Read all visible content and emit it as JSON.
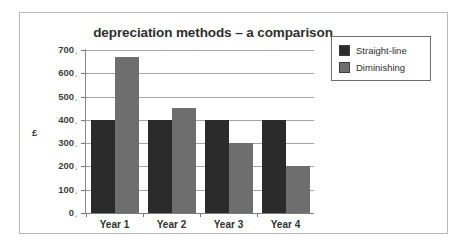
{
  "figure": {
    "border_color": "#b9b9b9",
    "background": "#ffffff"
  },
  "chart_data": {
    "type": "bar",
    "title": "depreciation methods – a comparison",
    "xlabel": "",
    "ylabel": "£",
    "categories": [
      "Year 1",
      "Year 2",
      "Year 3",
      "Year 4"
    ],
    "series": [
      {
        "name": "Straight-line",
        "color": "#2b2b2b",
        "values": [
          400,
          400,
          400,
          400
        ]
      },
      {
        "name": "Diminishing",
        "color": "#6e6e6e",
        "values": [
          670,
          450,
          300,
          200
        ]
      }
    ],
    "ylim": [
      0,
      700
    ],
    "ytick_step": 100,
    "ytick_labels": [
      "700",
      "600",
      "500",
      "400",
      "300",
      "200",
      "100",
      "0"
    ],
    "grid": true,
    "legend_position": "top-right"
  }
}
